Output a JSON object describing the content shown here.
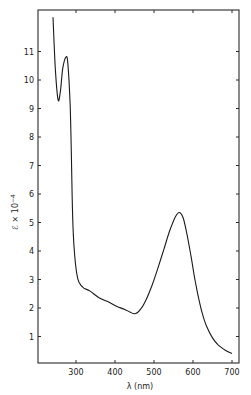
{
  "chart_data": {
    "type": "line",
    "title": "",
    "xlabel": "λ (nm)",
    "ylabel": "ℰ × 10⁻⁴",
    "xlim": [
      237,
      712
    ],
    "ylim": [
      0,
      12.2
    ],
    "grid": false,
    "legend": null,
    "x_ticks": [
      300,
      400,
      500,
      600,
      700
    ],
    "y_ticks": [
      1,
      2,
      3,
      4,
      5,
      6,
      7,
      8,
      9,
      10,
      11
    ],
    "series": [
      {
        "name": "absorption spectrum",
        "x": [
          241,
          247,
          254,
          260,
          266,
          274,
          279,
          285,
          288,
          290,
          293,
          297,
          302,
          308,
          320,
          335,
          360,
          385,
          405,
          425,
          450,
          465,
          480,
          495,
          510,
          525,
          540,
          555,
          565,
          575,
          585,
          595,
          605,
          615,
          625,
          635,
          650,
          665,
          685,
          700
        ],
        "y": [
          12.2,
          10.4,
          9.3,
          9.6,
          10.4,
          10.8,
          10.6,
          9.1,
          7.5,
          6.0,
          4.6,
          3.8,
          3.2,
          2.9,
          2.7,
          2.6,
          2.35,
          2.2,
          2.05,
          1.95,
          1.8,
          1.95,
          2.3,
          2.8,
          3.4,
          4.05,
          4.7,
          5.2,
          5.35,
          5.15,
          4.55,
          3.8,
          3.0,
          2.3,
          1.75,
          1.35,
          0.95,
          0.7,
          0.5,
          0.4
        ]
      }
    ]
  },
  "axes": {
    "x_label": "λ (nm)",
    "y_label_main": "ℰ × 10",
    "y_label_exp": "−4",
    "x_tick_labels": [
      "300",
      "400",
      "500",
      "600",
      "700"
    ],
    "y_tick_labels": [
      "1",
      "2",
      "3",
      "4",
      "5",
      "6",
      "7",
      "8",
      "9",
      "10",
      "11"
    ]
  },
  "colors": {
    "line": "#1a1a1a",
    "axis": "#2a2a2a",
    "background": "#ffffff"
  }
}
